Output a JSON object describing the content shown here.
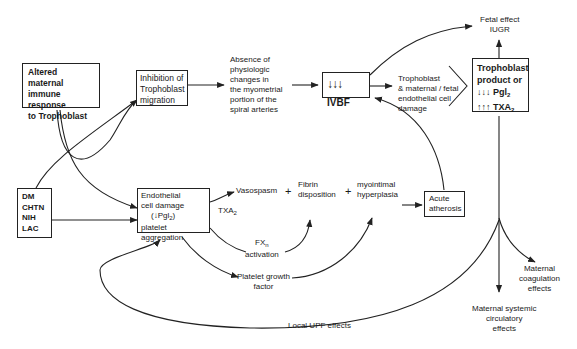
{
  "nodes": {
    "altered_immune": {
      "lines": [
        "Altered maternal",
        "immune response",
        "to Trophoblast"
      ]
    },
    "inhibition": {
      "lines": [
        "Inhibition  of",
        "Trophoblast",
        "migration"
      ]
    },
    "absence": {
      "lines": [
        "Absence of",
        "physiologic",
        "changes in",
        "the myometrial",
        "portion of the",
        "spiral arteries"
      ]
    },
    "ivbf": {
      "arrows": "↓↓↓",
      "label": "IVBF"
    },
    "tropho_damage": {
      "lines": [
        "Trophoblast",
        "& maternal / fetal",
        "endothelial cell",
        "damage"
      ]
    },
    "fetal_effect": {
      "lines": [
        "Fetal effect",
        "IUGR"
      ]
    },
    "tropho_product": {
      "line1": "Trophoblast",
      "line2": "product or",
      "pgi_arrows": "↓↓↓",
      "pgi": "Pgl",
      "pgi_sub": "2",
      "txa_arrows": "↑↑↑",
      "txa": "TXA",
      "txa_sub": "2"
    },
    "risk_factors": {
      "lines": [
        "DM",
        "CHTN",
        "NIH",
        "LAC"
      ]
    },
    "endothelial": {
      "line1": "Endothelial",
      "line2": "cell damage",
      "line3_prefix": "(↓Pgl",
      "line3_sub": "2",
      "line3_suffix": ")",
      "line4": "platelet aggregation"
    },
    "txa2_label": {
      "text": "TXA",
      "sub": "2"
    },
    "vasospasm": {
      "text": "Vasospasm"
    },
    "plus1": {
      "text": "+"
    },
    "fibrin": {
      "lines": [
        "Fibrin",
        "disposition"
      ]
    },
    "plus2": {
      "text": "+"
    },
    "myointimal": {
      "lines": [
        "myointimal",
        "hyperplasia"
      ]
    },
    "acute_atherosis": {
      "lines": [
        "Acute",
        "atherosis"
      ]
    },
    "fx": {
      "text": "FX",
      "sub": "n",
      "line2": "activation"
    },
    "platelet_growth": {
      "lines": [
        "Platelet growth",
        "factor"
      ]
    },
    "local_upf": {
      "text": "Local UPF effects"
    },
    "maternal_coag": {
      "lines": [
        "Maternal",
        "coagulation",
        "effects"
      ]
    },
    "maternal_systemic": {
      "lines": [
        "Maternal systemic",
        "circulatory",
        "effects"
      ]
    }
  }
}
